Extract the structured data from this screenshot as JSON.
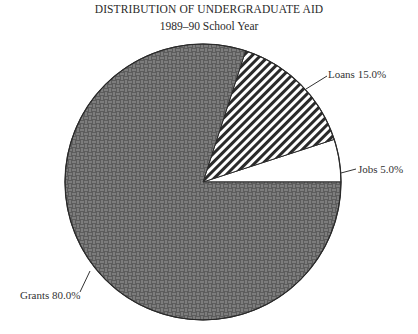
{
  "chart_data": {
    "type": "pie",
    "title": "DISTRIBUTION OF UNDERGRADUATE AID",
    "subtitle": "1989–90 School Year",
    "categories": [
      "Grants",
      "Loans",
      "Jobs"
    ],
    "values": [
      80.0,
      15.0,
      5.0
    ],
    "labels": [
      "Grants 80.0%",
      "Loans 15.0%",
      "Jobs 5.0%"
    ],
    "fills": [
      "basketweave-dark",
      "diagonal-stripes",
      "white"
    ],
    "legend": "none (callout labels)"
  }
}
